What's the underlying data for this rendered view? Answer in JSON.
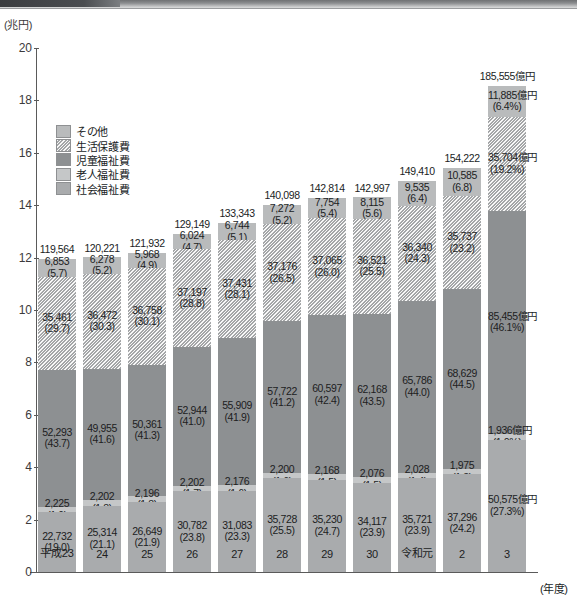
{
  "axis": {
    "y_unit": "(兆円)",
    "x_unit": "(年度)",
    "yticks": [
      "20",
      "18",
      "16",
      "14",
      "12",
      "10",
      "8",
      "6",
      "4",
      "2",
      "0"
    ],
    "ylim": [
      0,
      20
    ]
  },
  "legend": {
    "items": [
      {
        "label": "その他",
        "swatch": "legend-swatch-sonota",
        "color": "#b9bbbc"
      },
      {
        "label": "生活保護費",
        "swatch": "legend-swatch-seikatsuhogo",
        "color": "#cfd1d2"
      },
      {
        "label": "児童福祉費",
        "swatch": "legend-swatch-jidofukushi",
        "color": "#8d9092"
      },
      {
        "label": "老人福祉費",
        "swatch": "legend-swatch-rojinfukushi",
        "color": "#c5c7c8"
      },
      {
        "label": "社会福祉費",
        "swatch": "legend-swatch-shakaifukushi",
        "color": "#a9abad"
      }
    ]
  },
  "chart_data": {
    "type": "bar",
    "stacked": true,
    "title": "",
    "xlabel": "(年度)",
    "ylabel": "(兆円)",
    "ylim": [
      0,
      20
    ],
    "grid": false,
    "legend_position": "upper-left-inside",
    "unit_note": "億円",
    "categories": [
      "平成23",
      "24",
      "25",
      "26",
      "27",
      "28",
      "29",
      "30",
      "令和元",
      "2",
      "3"
    ],
    "totals": [
      "119,564",
      "120,221",
      "121,932",
      "129,149",
      "133,343",
      "140,098",
      "142,814",
      "142,997",
      "149,410",
      "154,222",
      "185,555億円"
    ],
    "totals_values": [
      119564,
      120221,
      121932,
      129149,
      133343,
      140098,
      142814,
      142997,
      149410,
      154222,
      185555
    ],
    "series": [
      {
        "name": "その他",
        "style": "c-sonota",
        "values": [
          6853,
          6278,
          5968,
          6024,
          6744,
          7272,
          7754,
          8115,
          9535,
          10585,
          11885
        ],
        "labels": [
          "6,853",
          "6,278",
          "5,968",
          "6,024",
          "6,744",
          "7,272",
          "7,754",
          "8,115",
          "9,535",
          "10,585",
          "11,885億円"
        ],
        "pct_labels": [
          "(5.7)",
          "(5.2)",
          "(4.9)",
          "(4.7)",
          "(5.1)",
          "(5.2)",
          "(5.4)",
          "(5.6)",
          "(6.4)",
          "(6.8)",
          "(6.4%)"
        ],
        "pct": [
          5.7,
          5.2,
          4.9,
          4.7,
          5.1,
          5.2,
          5.4,
          5.6,
          6.4,
          6.8,
          6.4
        ]
      },
      {
        "name": "生活保護費",
        "style": "c-seikatsu",
        "values": [
          35461,
          36472,
          36758,
          37197,
          37431,
          37176,
          37065,
          36521,
          36340,
          35737,
          35704
        ],
        "labels": [
          "35,461",
          "36,472",
          "36,758",
          "37,197",
          "37,431",
          "37,176",
          "37,065",
          "36,521",
          "36,340",
          "35,737",
          "35,704億円"
        ],
        "pct_labels": [
          "(29.7)",
          "(30.3)",
          "(30.1)",
          "(28.8)",
          "(28.1)",
          "(26.5)",
          "(26.0)",
          "(25.5)",
          "(24.3)",
          "(23.2)",
          "(19.2%)"
        ],
        "pct": [
          29.7,
          30.3,
          30.1,
          28.8,
          28.1,
          26.5,
          26.0,
          25.5,
          24.3,
          23.2,
          19.2
        ]
      },
      {
        "name": "児童福祉費",
        "style": "c-jido",
        "values": [
          52293,
          49955,
          50361,
          52944,
          55909,
          57722,
          60597,
          62168,
          65786,
          68629,
          85455
        ],
        "labels": [
          "52,293",
          "49,955",
          "50,361",
          "52,944",
          "55,909",
          "57,722",
          "60,597",
          "62,168",
          "65,786",
          "68,629",
          "85,455億円"
        ],
        "pct_labels": [
          "(43.7)",
          "(41.6)",
          "(41.3)",
          "(41.0)",
          "(41.9)",
          "(41.2)",
          "(42.4)",
          "(43.5)",
          "(44.0)",
          "(44.5)",
          "(46.1%)"
        ],
        "pct": [
          43.7,
          41.6,
          41.3,
          41.0,
          41.9,
          41.2,
          42.4,
          43.5,
          44.0,
          44.5,
          46.1
        ]
      },
      {
        "name": "老人福祉費",
        "style": "c-rojin",
        "values": [
          2225,
          2202,
          2196,
          2202,
          2176,
          2200,
          2168,
          2076,
          2028,
          1975,
          1936
        ],
        "labels": [
          "2,225",
          "2,202",
          "2,196",
          "2,202",
          "2,176",
          "2,200",
          "2,168",
          "2,076",
          "2,028",
          "1,975",
          "1,936億円"
        ],
        "pct_labels": [
          "(1.9)",
          "(1.8)",
          "(1.8)",
          "(1.7)",
          "(1.6)",
          "(1.6)",
          "(1.5)",
          "(1.5)",
          "(1.4)",
          "(1.3)",
          "(1.0%)"
        ],
        "pct": [
          1.9,
          1.8,
          1.8,
          1.7,
          1.6,
          1.6,
          1.5,
          1.5,
          1.4,
          1.3,
          1.0
        ]
      },
      {
        "name": "社会福祉費",
        "style": "c-shakai",
        "values": [
          22732,
          25314,
          26649,
          30782,
          31083,
          35728,
          35230,
          34117,
          35721,
          37296,
          50575
        ],
        "labels": [
          "22,732",
          "25,314",
          "26,649",
          "30,782",
          "31,083",
          "35,728",
          "35,230",
          "34,117",
          "35,721",
          "37,296",
          "50,575億円"
        ],
        "pct_labels": [
          "(19.0)",
          "(21.1)",
          "(21.9)",
          "(23.8)",
          "(23.3)",
          "(25.5)",
          "(24.7)",
          "(23.9)",
          "(23.9)",
          "(24.2)",
          "(27.3%)"
        ],
        "pct": [
          19.0,
          21.1,
          21.9,
          23.8,
          23.3,
          25.5,
          24.7,
          23.9,
          23.9,
          24.2,
          27.3
        ]
      }
    ]
  }
}
